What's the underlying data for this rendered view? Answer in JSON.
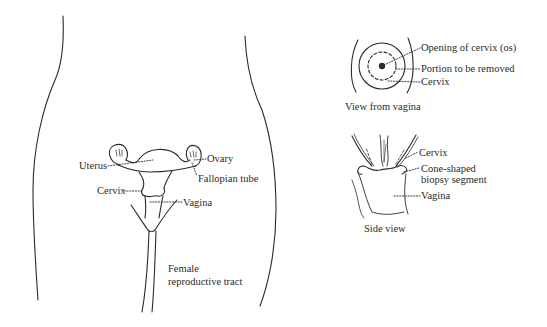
{
  "main_figure": {
    "caption_line1": "Female",
    "caption_line2": "reproductive tract",
    "labels": {
      "uterus": "Uterus",
      "ovary": "Ovary",
      "fallopian_tube": "Fallopian tube",
      "cervix": "Cervix",
      "vagina": "Vagina"
    }
  },
  "view_from_vagina": {
    "caption": "View from vagina",
    "labels": {
      "os": "Opening of cervix (os)",
      "portion": "Portion to be removed",
      "cervix": "Cervix"
    }
  },
  "side_view": {
    "caption": "Side view",
    "labels": {
      "cervix": "Cervix",
      "cone_line1": "Cone-shaped",
      "cone_line2": "biopsy segment",
      "vagina": "Vagina"
    }
  },
  "colors": {
    "line": "#2a2a2a",
    "background": "#ffffff"
  }
}
